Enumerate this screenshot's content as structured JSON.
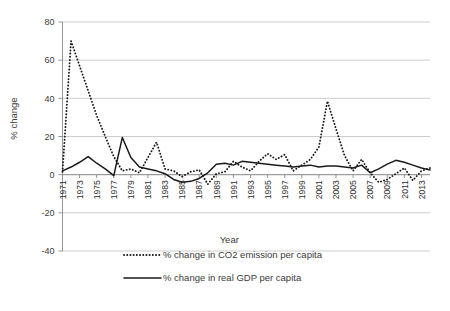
{
  "chart_data": {
    "type": "line",
    "title": "",
    "xlabel": "Year",
    "ylabel": "% change",
    "ylim": [
      -40,
      80
    ],
    "ytick_values": [
      -40,
      -20,
      0,
      20,
      40,
      60,
      80
    ],
    "ytick_labels": [
      "-40",
      "-20",
      "0",
      "20",
      "40",
      "60",
      "80"
    ],
    "grid": true,
    "legend_position": "bottom",
    "x": [
      1971,
      1972,
      1973,
      1974,
      1975,
      1976,
      1977,
      1978,
      1979,
      1980,
      1981,
      1982,
      1983,
      1984,
      1985,
      1986,
      1987,
      1988,
      1989,
      1990,
      1991,
      1992,
      1993,
      1994,
      1995,
      1996,
      1997,
      1998,
      1999,
      2000,
      2001,
      2002,
      2003,
      2004,
      2005,
      2006,
      2007,
      2008,
      2009,
      2010,
      2011,
      2012,
      2013,
      2014
    ],
    "xtick_labels": [
      "1971",
      "1973",
      "1975",
      "1977",
      "1979",
      "1981",
      "1983",
      "1985",
      "1987",
      "1989",
      "1991",
      "1993",
      "1995",
      "1997",
      "1999",
      "2001",
      "2003",
      "2005",
      "2007",
      "2009",
      "2011",
      "2013"
    ],
    "series": [
      {
        "name": "% change in CO2 emission per capita",
        "style": "dotted",
        "color": "#1a1a1a",
        "values": [
          1.5,
          70.0,
          57.0,
          44.0,
          31.0,
          20.0,
          9.5,
          2.0,
          3.0,
          1.0,
          9.0,
          17.0,
          3.0,
          2.0,
          -1.0,
          1.5,
          2.5,
          -5.0,
          0.5,
          1.5,
          7.0,
          4.0,
          2.0,
          7.0,
          11.0,
          8.0,
          10.5,
          2.0,
          5.0,
          8.0,
          14.5,
          38.5,
          24.0,
          10.0,
          2.0,
          8.0,
          1.0,
          -4.0,
          -2.5,
          0.5,
          3.5,
          -3.0,
          2.0,
          3.5
        ]
      },
      {
        "name": "% change in real GDP per capita",
        "style": "solid",
        "color": "#1a1a1a",
        "values": [
          2.0,
          4.0,
          6.5,
          9.5,
          6.0,
          3.0,
          -0.5,
          19.5,
          9.0,
          4.0,
          3.0,
          2.0,
          0.5,
          -2.5,
          -4.0,
          -3.5,
          -2.0,
          1.0,
          5.5,
          6.0,
          5.0,
          7.0,
          6.5,
          6.0,
          5.5,
          5.0,
          4.5,
          4.0,
          4.5,
          5.0,
          4.0,
          4.5,
          4.5,
          4.0,
          3.5,
          5.0,
          1.0,
          3.0,
          5.5,
          7.5,
          6.5,
          5.0,
          3.5,
          2.5
        ]
      }
    ],
    "series_right": {
      "note": "values continue to 2014 along the same x axis"
    }
  },
  "legend": {
    "items": [
      {
        "label": "% change in CO2 emission per capita",
        "style": "dotted"
      },
      {
        "label": "% change in real GDP per capita",
        "style": "solid"
      }
    ]
  },
  "axes": {
    "y_title": "% change",
    "x_title": "Year"
  }
}
